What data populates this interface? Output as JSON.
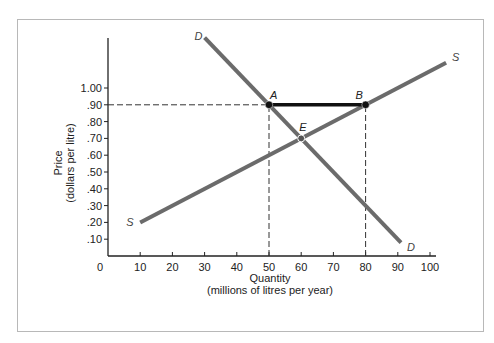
{
  "chart_data": {
    "type": "line",
    "title": "",
    "xlabel": "Quantity",
    "xlabel_sub": "(millions of litres per year)",
    "ylabel": "Price",
    "ylabel_sub": "(dollars per litre)",
    "x_ticks": [
      "0",
      "10",
      "20",
      "30",
      "40",
      "50",
      "60",
      "70",
      "80",
      "90",
      "100"
    ],
    "y_ticks": [
      ".10",
      ".20",
      ".30",
      ".40",
      ".50",
      ".60",
      ".70",
      ".80",
      ".90",
      "1.00"
    ],
    "xlim": [
      0,
      100
    ],
    "ylim": [
      0,
      1.0
    ],
    "grid": false,
    "series": [
      {
        "name": "D",
        "label_start": "D",
        "label_end": "D",
        "x": [
          30,
          91
        ],
        "y": [
          1.3,
          0.08
        ],
        "color": "#6b6b6b"
      },
      {
        "name": "S",
        "label_start": "S",
        "label_end": "S",
        "x": [
          10,
          105
        ],
        "y": [
          0.2,
          1.15
        ],
        "color": "#6b6b6b"
      }
    ],
    "points": [
      {
        "label": "A",
        "x": 50,
        "y": 0.9
      },
      {
        "label": "B",
        "x": 80,
        "y": 0.9
      },
      {
        "label": "E",
        "x": 60,
        "y": 0.7
      }
    ],
    "segments": [
      {
        "from": "A",
        "to": "B",
        "style": "solid-bold"
      }
    ],
    "reference_lines": [
      {
        "type": "horizontal-dashed",
        "y": 0.9,
        "x_from": 0,
        "x_to": 50
      },
      {
        "type": "vertical-dashed",
        "x": 50,
        "y_from": 0,
        "y_to": 0.9
      },
      {
        "type": "vertical-dashed",
        "x": 80,
        "y_from": 0,
        "y_to": 0.9
      }
    ]
  }
}
